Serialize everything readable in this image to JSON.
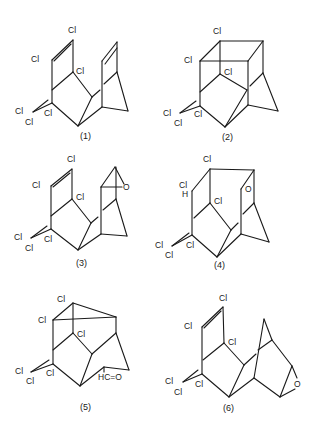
{
  "figure": {
    "structures": [
      {
        "id": "1",
        "caption": "(1)",
        "atoms": [
          "Cl",
          "Cl",
          "Cl",
          "Cl",
          "Cl",
          "Cl"
        ]
      },
      {
        "id": "2",
        "caption": "(2)",
        "atoms": [
          "Cl",
          "Cl",
          "Cl",
          "Cl",
          "Cl",
          "Cl"
        ]
      },
      {
        "id": "3",
        "caption": "(3)",
        "atoms": [
          "Cl",
          "Cl",
          "Cl",
          "Cl",
          "Cl",
          "Cl",
          "O"
        ]
      },
      {
        "id": "4",
        "caption": "(4)",
        "atoms": [
          "Cl",
          "Cl",
          "H",
          "Cl",
          "Cl",
          "Cl",
          "Cl",
          "O"
        ]
      },
      {
        "id": "5",
        "caption": "(5)",
        "atoms": [
          "Cl",
          "Cl",
          "Cl",
          "Cl",
          "Cl",
          "Cl",
          "HC=O"
        ]
      },
      {
        "id": "6",
        "caption": "(6)",
        "atoms": [
          "Cl",
          "Cl",
          "Cl",
          "Cl",
          "Cl",
          "Cl",
          "O"
        ]
      }
    ]
  }
}
